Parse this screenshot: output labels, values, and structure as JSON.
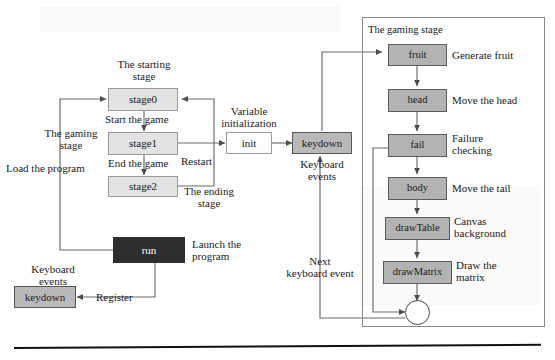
{
  "diagram": {
    "type": "flowchart",
    "colors": {
      "node_light": "#e3e3e3",
      "node_mid": "#b9b9b9",
      "node_right": "#b3b3b3",
      "node_dark": "#2e2e2e",
      "node_white": "#fdfdfd",
      "line": "#555555",
      "panel_border": "#8a8a8a",
      "rule": "#111111"
    },
    "nodes": {
      "stage0": "stage0",
      "stage1": "stage1",
      "stage2": "stage2",
      "init": "init",
      "run": "run",
      "keydown_left": "keydown",
      "keydown_mid": "keydown",
      "fruit": "fruit",
      "head": "head",
      "fail": "fail",
      "body": "body",
      "drawTable": "drawTable",
      "drawMatrix": "drawMatrix",
      "loop_junction": ""
    },
    "labels": {
      "starting_stage": "The starting\nstage",
      "gaming_stage_left": "The gaming\nstage",
      "ending_stage": "The ending\nstage",
      "variable_initialization": "Variable\ninitialization",
      "start_the_game": "Start the game",
      "end_the_game": "End the game",
      "restart": "Restart",
      "load_the_program": "Load the program",
      "launch_the_program": "Launch the\nprogram",
      "register": "Register",
      "keyboard_events_left": "Keyboard\nevents",
      "keyboard_events_mid": "Keyboard\nevents",
      "next_keyboard_event": "Next\nkeyboard event"
    },
    "panel": {
      "title": "The gaming stage",
      "annotations": {
        "fruit": "Generate fruit",
        "head": "Move the head",
        "fail": "Failure\nchecking",
        "body": "Move the tail",
        "drawTable": "Canvas\nbackground",
        "drawMatrix": "Draw the\nmatrix"
      }
    },
    "edges": [
      {
        "from": "run",
        "to": "stage0",
        "label": "Load the program"
      },
      {
        "from": "run",
        "to": "keydown_left",
        "label": "Register"
      },
      {
        "from": "stage0",
        "to": "stage1",
        "label": "Start the game"
      },
      {
        "from": "stage1",
        "to": "stage2",
        "label": "End the game"
      },
      {
        "from": "stage1",
        "to": "init",
        "label": ""
      },
      {
        "from": "stage2",
        "to": "stage0",
        "label": "Restart"
      },
      {
        "from": "init",
        "to": "keydown_mid",
        "label": ""
      },
      {
        "from": "keydown_mid",
        "to": "fruit",
        "label": ""
      },
      {
        "from": "fruit",
        "to": "head",
        "label": ""
      },
      {
        "from": "head",
        "to": "fail",
        "label": ""
      },
      {
        "from": "fail",
        "to": "body",
        "label": ""
      },
      {
        "from": "fail",
        "to": "loop_junction",
        "label": ""
      },
      {
        "from": "body",
        "to": "drawTable",
        "label": ""
      },
      {
        "from": "drawTable",
        "to": "drawMatrix",
        "label": ""
      },
      {
        "from": "drawMatrix",
        "to": "loop_junction",
        "label": ""
      },
      {
        "from": "loop_junction",
        "to": "keydown_mid",
        "label": "Next keyboard event"
      }
    ]
  }
}
